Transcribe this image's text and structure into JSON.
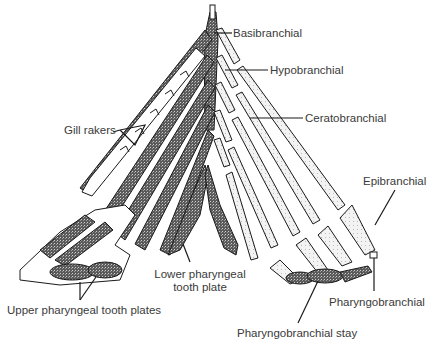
{
  "diagram": {
    "colors": {
      "ink": "#1a1a1a",
      "label": "#3a3a3a",
      "stipple_dark": "#4a4a4a",
      "background": "#ffffff"
    },
    "labels": {
      "basibranchial": "Basibranchial",
      "hypobranchial": "Hypobranchial",
      "ceratobranchial": "Ceratobranchial",
      "gill_rakers": "Gill rakers",
      "epibranchial": "Epibranchial",
      "lower_pharyngeal_line1": "Lower pharyngeal",
      "lower_pharyngeal_line2": "tooth plate",
      "upper_pharyngeal": "Upper pharyngeal tooth plates",
      "pharyngobranchial": "Pharyngobranchial",
      "pharyngobranchial_stay": "Pharyngobranchial stay"
    }
  }
}
